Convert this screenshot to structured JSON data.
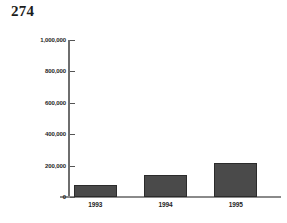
{
  "page": {
    "number": "274"
  },
  "chart_data": {
    "type": "bar",
    "title": "",
    "subtitle": "",
    "xlabel": "",
    "ylabel": "",
    "categories": [
      "1993",
      "1994",
      "1995"
    ],
    "values": [
      76000,
      140000,
      215000
    ],
    "ylim": [
      0,
      1000000
    ],
    "yticks": [
      0,
      200000,
      400000,
      600000,
      800000,
      1000000
    ],
    "ytick_labels": [
      "0",
      "200,000",
      "400,000",
      "600,000",
      "800,000",
      "1,000,000"
    ],
    "grid": false,
    "legend": false,
    "bar_color": "#4a4a4a",
    "bar_border_color": "#2b2b2b",
    "axis_color": "#6e6e6e",
    "background_color": "#ffffff"
  }
}
